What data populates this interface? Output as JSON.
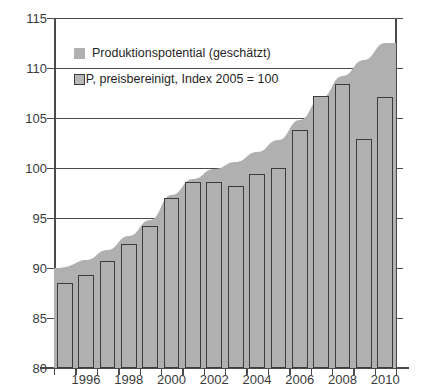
{
  "chart_data": {
    "type": "area",
    "title": "",
    "subtitle": "",
    "xlabel": "",
    "ylabel": "",
    "ylim": [
      80,
      115
    ],
    "ytick_step": 5,
    "yticks": [
      80,
      85,
      90,
      95,
      100,
      105,
      110,
      115
    ],
    "xticks": [
      "1996",
      "1998",
      "2000",
      "2002",
      "2004",
      "2006",
      "2008",
      "2010"
    ],
    "grid": true,
    "legend_position": "top-left",
    "x": [
      1995,
      1996,
      1997,
      1998,
      1999,
      2000,
      2001,
      2002,
      2003,
      2004,
      2005,
      2006,
      2007,
      2008,
      2009,
      2010
    ],
    "categories": [
      "1995",
      "1996",
      "1997",
      "1998",
      "1999",
      "2000",
      "2001",
      "2002",
      "2003",
      "2004",
      "2005",
      "2006",
      "2007",
      "2008",
      "2009",
      "2010"
    ],
    "series": [
      {
        "name": "Produktionspotential (geschätzt)",
        "type": "area",
        "color": "#b0b0b0",
        "values": [
          90.0,
          90.8,
          91.8,
          93.2,
          94.8,
          97.3,
          98.9,
          99.9,
          100.6,
          101.6,
          102.8,
          104.8,
          107.0,
          109.2,
          110.8,
          112.5
        ]
      },
      {
        "name": "BIP, preisbereinigt, Index 2005 = 100",
        "type": "bar",
        "color": "#b0b0b0",
        "edge_color": "#3b3b3b",
        "values": [
          88.5,
          89.3,
          90.7,
          92.4,
          94.2,
          97.0,
          98.6,
          98.6,
          98.2,
          99.4,
          100.0,
          103.8,
          107.2,
          108.4,
          102.9,
          107.1
        ]
      }
    ]
  },
  "legend": {
    "items": [
      {
        "label": "Produktionspotential (geschätzt)",
        "swatch": "area"
      },
      {
        "label": "BIP, preisbereinigt, Index 2005 = 100",
        "swatch": "bar"
      }
    ]
  },
  "colors": {
    "area_fill": "#b0b0b0",
    "bar_fill": "#b0b0b0",
    "bar_edge": "#3b3b3b",
    "axis": "#4a4a4a",
    "text": "#2b2b2b",
    "background": "#ffffff"
  }
}
